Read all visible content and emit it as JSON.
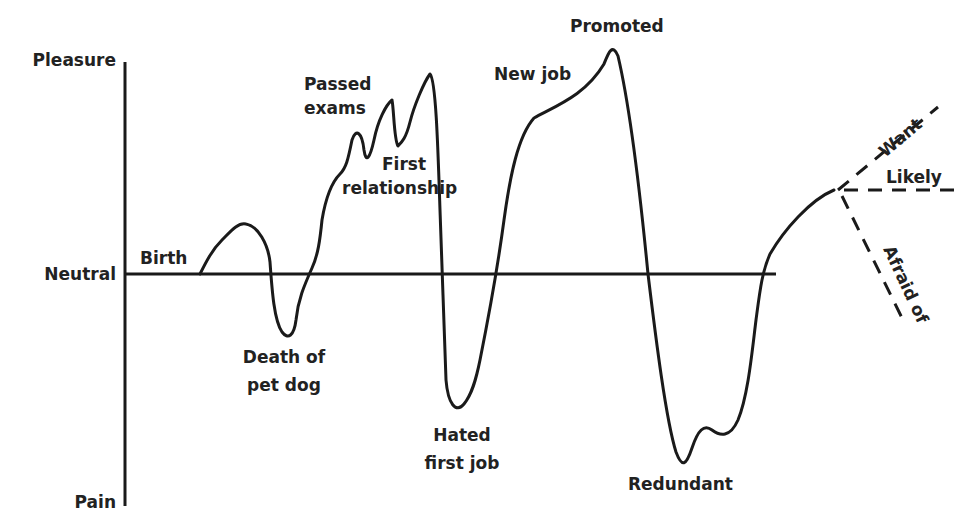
{
  "diagram": {
    "line_color": "#1a1a1a",
    "text_color": "#222222",
    "axis": {
      "top_label": "Pleasure",
      "middle_label": "Neutral",
      "bottom_label": "Pain"
    },
    "events": {
      "birth": "Birth",
      "death_line1": "Death of",
      "death_line2": "pet dog",
      "passed_line1": "Passed",
      "passed_line2": "exams",
      "first_line1": "First",
      "first_line2": "relationship",
      "hated_line1": "Hated",
      "hated_line2": "first job",
      "new_job": "New job",
      "promoted": "Promoted",
      "redundant": "Redundant"
    },
    "future": {
      "want": "Want",
      "likely": "Likely",
      "afraid": "Afraid of"
    }
  }
}
